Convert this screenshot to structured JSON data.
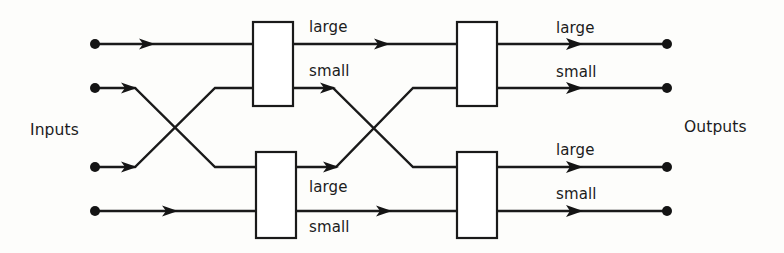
{
  "diagram": {
    "stroke_color": "#1a1a1a",
    "background_color": "#fdfdfb",
    "side_labels": {
      "inputs": "Inputs",
      "outputs": "Outputs"
    },
    "port_labels": {
      "large": "large",
      "small": "small"
    },
    "comparator_boxes": [
      {
        "id": "box-top-left",
        "x": 253,
        "y": 22,
        "w": 40,
        "h": 84
      },
      {
        "id": "box-top-right",
        "x": 457,
        "y": 22,
        "w": 40,
        "h": 84
      },
      {
        "id": "box-bottom-left",
        "x": 256,
        "y": 152,
        "w": 40,
        "h": 86
      },
      {
        "id": "box-bottom-right",
        "x": 457,
        "y": 152,
        "w": 40,
        "h": 86
      }
    ],
    "input_terminals": [
      {
        "id": "input-1",
        "x": 95,
        "y": 44
      },
      {
        "id": "input-2",
        "x": 95,
        "y": 88
      },
      {
        "id": "input-3",
        "x": 95,
        "y": 167
      },
      {
        "id": "input-4",
        "x": 95,
        "y": 211
      }
    ],
    "output_terminals": [
      {
        "id": "output-1",
        "x": 667,
        "y": 44
      },
      {
        "id": "output-2",
        "x": 667,
        "y": 88
      },
      {
        "id": "output-3",
        "x": 667,
        "y": 167
      },
      {
        "id": "output-4",
        "x": 667,
        "y": 211
      }
    ],
    "edge_labels": [
      {
        "id": "label-stage1-top-large",
        "text": "large",
        "x": 309,
        "y": 18
      },
      {
        "id": "label-stage1-top-small",
        "text": "small",
        "x": 309,
        "y": 62
      },
      {
        "id": "label-stage2-top-large",
        "text": "large",
        "x": 556,
        "y": 19
      },
      {
        "id": "label-stage2-top-small",
        "text": "small",
        "x": 556,
        "y": 63
      },
      {
        "id": "label-stage1-bottom-large",
        "text": "large",
        "x": 309,
        "y": 178
      },
      {
        "id": "label-stage1-bottom-small",
        "text": "small",
        "x": 309,
        "y": 218
      },
      {
        "id": "label-stage2-bottom-large",
        "text": "large",
        "x": 556,
        "y": 141
      },
      {
        "id": "label-stage2-bottom-small",
        "text": "small",
        "x": 556,
        "y": 185
      }
    ]
  }
}
